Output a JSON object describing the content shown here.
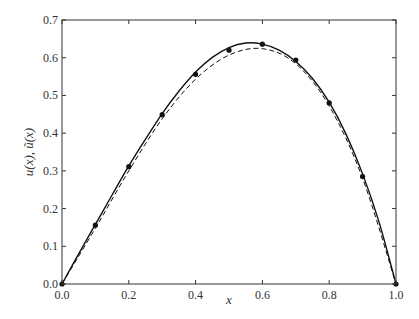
{
  "chart_data": {
    "type": "line",
    "title": "",
    "xlabel": "x",
    "ylabel": "u(x), ũ(x)",
    "xlim": [
      0.0,
      1.0
    ],
    "ylim": [
      0.0,
      0.7
    ],
    "xticks": [
      "0.0",
      "0.2",
      "0.4",
      "0.6",
      "0.8",
      "1.0"
    ],
    "yticks": [
      "0.0",
      "0.1",
      "0.2",
      "0.3",
      "0.4",
      "0.5",
      "0.6",
      "0.7"
    ],
    "grid": false,
    "legend": null,
    "series": [
      {
        "name": "u(x) exact (solid)",
        "style": "solid",
        "x": [
          0.0,
          0.05,
          0.1,
          0.15,
          0.2,
          0.25,
          0.3,
          0.35,
          0.4,
          0.45,
          0.5,
          0.55,
          0.6,
          0.65,
          0.7,
          0.75,
          0.8,
          0.85,
          0.9,
          0.95,
          1.0
        ],
        "values": [
          0.0,
          0.08,
          0.158,
          0.236,
          0.313,
          0.384,
          0.452,
          0.511,
          0.562,
          0.601,
          0.627,
          0.639,
          0.636,
          0.62,
          0.59,
          0.545,
          0.482,
          0.398,
          0.292,
          0.162,
          0.0
        ]
      },
      {
        "name": "ũ(x) approximate (dashed)",
        "style": "dashed",
        "x": [
          0.0,
          0.1,
          0.2,
          0.3,
          0.4,
          0.5,
          0.6,
          0.7,
          0.8,
          0.9,
          1.0
        ],
        "values": [
          0.0,
          0.148,
          0.3,
          0.438,
          0.543,
          0.607,
          0.624,
          0.584,
          0.472,
          0.28,
          0.0
        ]
      },
      {
        "name": "nodes (markers)",
        "style": "markers",
        "x": [
          0.0,
          0.1,
          0.2,
          0.3,
          0.4,
          0.5,
          0.6,
          0.7,
          0.8,
          0.9,
          1.0
        ],
        "values": [
          0.0,
          0.156,
          0.311,
          0.449,
          0.556,
          0.62,
          0.636,
          0.594,
          0.48,
          0.285,
          0.0
        ]
      }
    ]
  }
}
